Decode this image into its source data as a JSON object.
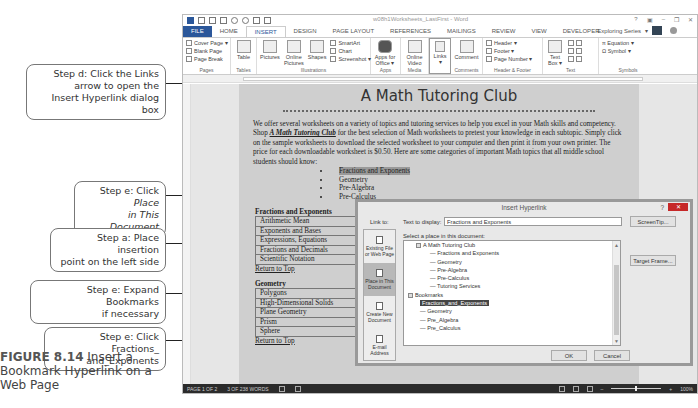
{
  "callouts": [
    {
      "id": "step-d",
      "text": "Step d: Click the Links arrow to open the Insert Hyperlink dialog box"
    },
    {
      "id": "step-e-place",
      "text": "Step e: Click Place in This Document"
    },
    {
      "id": "step-a",
      "text": "Step a: Place insertion point on the left side"
    },
    {
      "id": "step-e-expand",
      "text": "Step e: Expand Bookmarks if necessary"
    },
    {
      "id": "step-e-click",
      "text": "Step e: Click Fractions_ and_Exponents"
    }
  ],
  "callout_lines": {
    "d1": "Step d: Click the Links",
    "d2": "arrow to open the",
    "d3": "Insert Hyperlink dialog box",
    "ep1": "Step e: Click ",
    "ep1i": "Place",
    "ep2i": "in This Document",
    "a1": "Step a: Place insertion",
    "a2": "point on the left side",
    "ee1": "Step e: Expand Bookmarks",
    "ee2": "if necessary",
    "ec1": "Step e: Click Fractions_",
    "ec2": "and_Exponents"
  },
  "figure": {
    "number": "FIGURE 8.14",
    "caption": " Insert a Bookmark Hyperlink on a Web Page"
  },
  "window": {
    "title": "w08h1Worksheets_LastFirst - Word",
    "controls": [
      "?",
      "▣",
      "–",
      "❐",
      "✕"
    ],
    "user": "Exploring Series"
  },
  "tabs": [
    "FILE",
    "HOME",
    "INSERT",
    "DESIGN",
    "PAGE LAYOUT",
    "REFERENCES",
    "MAILINGS",
    "REVIEW",
    "VIEW",
    "DEVELOPER"
  ],
  "active_tab": "INSERT",
  "ribbon": {
    "pages": {
      "label": "Pages",
      "items": [
        "Cover Page ▾",
        "Blank Page",
        "Page Break"
      ]
    },
    "tables": {
      "label": "Tables",
      "items": [
        "Table"
      ]
    },
    "illustrations": {
      "label": "Illustrations",
      "items": [
        "Pictures",
        "Online Pictures",
        "Shapes",
        "SmartArt",
        "Chart",
        "Screenshot ▾"
      ]
    },
    "apps": {
      "label": "Apps",
      "items": [
        "Apps for Office ▾"
      ]
    },
    "media": {
      "label": "Media",
      "items": [
        "Online Video"
      ]
    },
    "links": {
      "label": "",
      "items": [
        "Links"
      ]
    },
    "comments": {
      "label": "Comments",
      "items": [
        "Comment"
      ]
    },
    "header_footer": {
      "label": "Header & Footer",
      "items": [
        "Header ▾",
        "Footer ▾",
        "Page Number ▾"
      ]
    },
    "text": {
      "label": "Text",
      "items": [
        "Text Box ▾"
      ]
    },
    "symbols": {
      "label": "Symbols",
      "items": [
        "π Equation ▾",
        "Ω Symbol ▾"
      ]
    }
  },
  "document": {
    "title": "A Math Tutoring Club",
    "intro_a": "We offer several worksheets on a variety of topics and tutoring services to help you excel in your Math skills and competency. Shop ",
    "intro_b": "A Math Tutoring Club",
    "intro_c": " for the best selection of Math worksheets to pretest your knowledge in each subtopic. Simply click on the sample worksheets to download the selected worksheet to your computer and then print it from your own printer. The price for each downloadable worksheet is $0.50. Here are some categories of important Math topics that all middle school students should know:",
    "bullets": [
      "Fractions and Exponents",
      "Geometry",
      "Pre-Algebra",
      "Pre-Calculus"
    ],
    "sections": [
      {
        "heading": "Fractions and Exponents",
        "rows": [
          "Arithmetic Mean",
          "Exponents and Bases",
          "Expressions, Equations",
          "Fractions and Decimals",
          "Scientific Notation"
        ],
        "return": "Return to Top"
      },
      {
        "heading": "Geometry",
        "rows": [
          "Polygons",
          "High-Dimensional Solids",
          "Plane Geometry",
          "Prism",
          "Sphere"
        ],
        "return": "Return to Top"
      }
    ]
  },
  "status": {
    "page": "PAGE 1 OF 2",
    "words": "3 OF 238 WORDS",
    "zoom": "100%"
  },
  "dialog": {
    "title": "Insert Hyperlink",
    "help": "?",
    "close": "✕",
    "link_to_label": "Link to:",
    "link_to": [
      "Existing File or Web Page",
      "Place in This Document",
      "Create New Document",
      "E-mail Address"
    ],
    "active_link_to": "Place in This Document",
    "text_to_display_label": "Text to display:",
    "text_to_display": "Fractions and Exponents",
    "screentip": "ScreenTip...",
    "select_label": "Select a place in this document:",
    "tree": {
      "root": "A Math Tutoring Club",
      "headings": [
        "Fractions and Exponents",
        "Geometry",
        "Pre-Algebra",
        "Pre-Calculus",
        "Tutoring Services"
      ],
      "bookmarks_label": "Bookmarks",
      "bookmarks": [
        "Fractions_and_Exponents",
        "Geometry",
        "Pre_Algebra",
        "Pre_Calculus"
      ],
      "selected": "Fractions_and_Exponents"
    },
    "target_frame": "Target Frame...",
    "ok": "OK",
    "cancel": "Cancel"
  }
}
